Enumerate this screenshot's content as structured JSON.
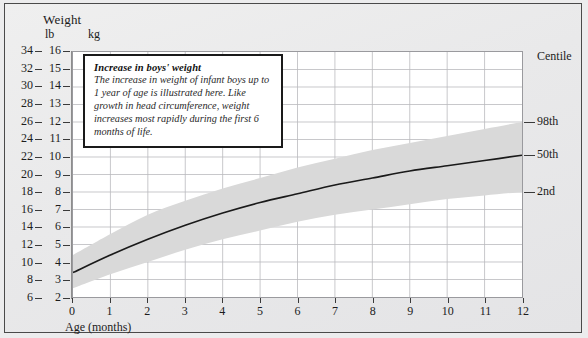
{
  "header": {
    "title": "Weight",
    "unit_left": "lb",
    "unit_right": "kg"
  },
  "caption": {
    "title": "Increase in boys' weight",
    "body": "The increase in weight of infant boys up to 1 year of age is illustrated here. Like growth in head circumference, weight increases most rapidly during the first 6 months of life."
  },
  "axes": {
    "x_title": "Age (months)",
    "right_header": "Centile"
  },
  "chart_data": {
    "type": "line",
    "title": "Increase in boys' weight",
    "xlabel": "Age (months)",
    "ylabel": "Weight",
    "xlim": [
      0,
      12
    ],
    "ylim_kg": [
      2,
      16
    ],
    "ylim_lb": [
      6,
      34
    ],
    "grid": true,
    "legend_position": "right-axis",
    "x": [
      0,
      1,
      2,
      3,
      4,
      5,
      6,
      7,
      8,
      9,
      10,
      11,
      12
    ],
    "y_tick_labels_kg": [
      "2",
      "3",
      "4",
      "5",
      "6",
      "7",
      "8",
      "9",
      "10",
      "11",
      "12",
      "13",
      "14",
      "15",
      "16"
    ],
    "y_tick_values_kg": [
      2,
      3,
      4,
      5,
      6,
      7,
      8,
      9,
      10,
      11,
      12,
      13,
      14,
      15,
      16
    ],
    "y_tick_labels_lb": [
      "6",
      "8",
      "10",
      "12",
      "14",
      "16",
      "18",
      "20",
      "22",
      "24",
      "26",
      "28",
      "30",
      "32",
      "34"
    ],
    "y_tick_values_lb": [
      6,
      8,
      10,
      12,
      14,
      16,
      18,
      20,
      22,
      24,
      26,
      28,
      30,
      32,
      34
    ],
    "x_tick_labels": [
      "0",
      "1",
      "2",
      "3",
      "4",
      "5",
      "6",
      "7",
      "8",
      "9",
      "10",
      "11",
      "12"
    ],
    "series": [
      {
        "name": "98th",
        "label": "98th",
        "units": "kg",
        "values": [
          4.4,
          5.6,
          6.7,
          7.5,
          8.2,
          8.8,
          9.4,
          9.9,
          10.4,
          10.8,
          11.2,
          11.6,
          12.0
        ]
      },
      {
        "name": "50th",
        "label": "50th",
        "units": "kg",
        "values": [
          3.4,
          4.4,
          5.3,
          6.1,
          6.8,
          7.4,
          7.9,
          8.4,
          8.8,
          9.2,
          9.5,
          9.8,
          10.1
        ]
      },
      {
        "name": "2nd",
        "label": "2nd",
        "units": "kg",
        "values": [
          2.5,
          3.3,
          4.0,
          4.7,
          5.3,
          5.8,
          6.3,
          6.7,
          7.0,
          7.3,
          7.6,
          7.8,
          8.0
        ]
      }
    ],
    "band": {
      "fill": "#d9d9d9",
      "upper_series": "98th",
      "lower_series": "2nd"
    },
    "line_color": "#1a1a1a",
    "centile_labels": [
      "98th",
      "50th",
      "2nd"
    ]
  }
}
